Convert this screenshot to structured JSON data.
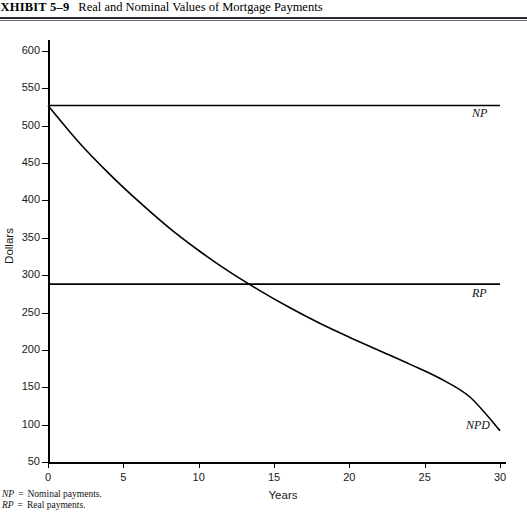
{
  "exhibit": {
    "label": "EXHIBIT 5–9",
    "title": "Real and Nominal Values of Mortgage Payments"
  },
  "footnotes": [
    {
      "abbr": "NP",
      "eq": "=",
      "text": "Nominal payments."
    },
    {
      "abbr": "RP",
      "eq": "=",
      "text": "Real payments."
    }
  ],
  "colors": {
    "line": "#000000",
    "rule": "#2b2b36",
    "text": "#111111",
    "background": "#ffffff"
  },
  "chart_data": {
    "type": "line",
    "title": "Real and Nominal Values of Mortgage Payments",
    "xlabel": "Years",
    "ylabel": "Dollars",
    "xlim": [
      0,
      30
    ],
    "ylim": [
      50,
      600
    ],
    "grid": false,
    "legend": "inline-right-of-curve",
    "xticks": [
      0,
      5,
      10,
      15,
      20,
      25,
      30
    ],
    "yticks": [
      50,
      100,
      150,
      200,
      250,
      300,
      350,
      400,
      450,
      500,
      550,
      600
    ],
    "x": [
      0,
      2,
      4,
      6,
      8,
      10,
      12,
      14,
      16,
      18,
      20,
      22,
      24,
      26,
      28,
      30
    ],
    "series": [
      {
        "name": "NP",
        "label": "NP",
        "description": "Nominal payments",
        "values": [
          527,
          527,
          527,
          527,
          527,
          527,
          527,
          527,
          527,
          527,
          527,
          527,
          527,
          527,
          527,
          527
        ]
      },
      {
        "name": "RP",
        "label": "RP",
        "description": "Real payments",
        "values": [
          288,
          288,
          288,
          288,
          288,
          288,
          288,
          288,
          288,
          288,
          288,
          288,
          288,
          288,
          288,
          288
        ]
      },
      {
        "name": "NPD",
        "label": "NPD",
        "description": "Nominal payments discounted",
        "values": [
          527,
          479,
          437,
          399,
          364,
          333,
          305,
          280,
          257,
          236,
          217,
          199,
          181,
          162,
          137,
          92
        ]
      }
    ],
    "annotations": [
      {
        "text": "NP",
        "x": 30,
        "y": 560
      },
      {
        "text": "RP",
        "x": 30,
        "y": 318
      },
      {
        "text": "NPD",
        "x": 27.5,
        "y": 148
      }
    ]
  }
}
